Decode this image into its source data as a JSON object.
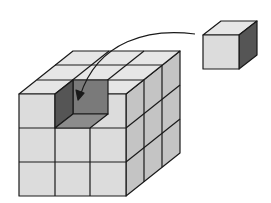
{
  "diagram": {
    "big_cube": {
      "grid": [
        3,
        3,
        3
      ],
      "missing_cell": "top-front-middle"
    },
    "single_cube": {
      "count": 1
    },
    "arrow": {
      "from": "single-cube",
      "to": "missing-slot"
    },
    "colors": {
      "background": "#ffffff",
      "front_face": "#dcdcdc",
      "top_face": "#e6e6e6",
      "side_face": "#c4c4c4",
      "hole_dark": "#555555",
      "hole_mid": "#7a7a7a",
      "hole_floor": "#8c8c8c",
      "small_side": "#555555",
      "edge": "#1a1a1a"
    }
  }
}
